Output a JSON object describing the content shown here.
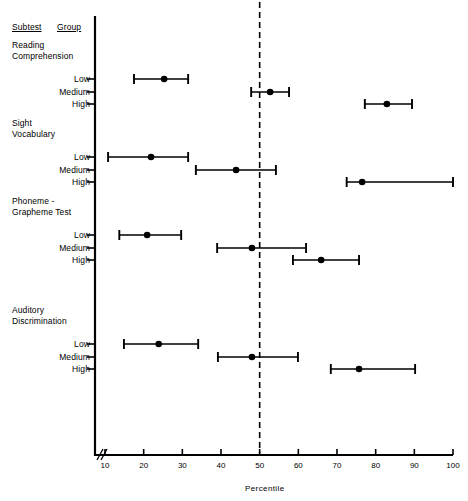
{
  "headers": {
    "subtest": "Subtest",
    "group": "Group"
  },
  "axis": {
    "title": "Percentile",
    "ticks": [
      10,
      20,
      30,
      40,
      50,
      60,
      70,
      80,
      90,
      100
    ],
    "break_symbol": "axis-break",
    "reference_line_value": 50,
    "xmin": 10,
    "xmax": 100
  },
  "chart_data": {
    "type": "scatter",
    "title": "",
    "xlabel": "Percentile",
    "ylabel": "",
    "xlim": [
      10,
      100
    ],
    "grid": false,
    "legend": null,
    "annotations": [
      {
        "type": "vline",
        "value": 50,
        "style": "dashed",
        "label": "50th percentile"
      },
      {
        "type": "axis-break",
        "position": "x-origin"
      }
    ],
    "error_bar_orientation": "horizontal",
    "groups": [
      {
        "subtest": "Reading Comprehension",
        "subtest_lines": [
          "Reading",
          "Comprehension"
        ],
        "rows": [
          {
            "group": "Low",
            "value": 25.3,
            "low": 17.5,
            "high": 31.5
          },
          {
            "group": "Medium",
            "value": 52.7,
            "low": 47.8,
            "high": 57.6
          },
          {
            "group": "High",
            "value": 82.9,
            "low": 77.2,
            "high": 89.4
          }
        ]
      },
      {
        "subtest": "Sight Vocabulary",
        "subtest_lines": [
          "Sight",
          "Vocabulary"
        ],
        "rows": [
          {
            "group": "Low",
            "value": 21.9,
            "low": 10.8,
            "high": 31.5
          },
          {
            "group": "Medium",
            "value": 43.9,
            "low": 33.5,
            "high": 54.2
          },
          {
            "group": "High",
            "value": 76.5,
            "low": 72.5,
            "high": 100.0
          }
        ]
      },
      {
        "subtest": "Phoneme-Grapheme Test",
        "subtest_lines": [
          "Phoneme -",
          "Grapheme Test"
        ],
        "rows": [
          {
            "group": "Low",
            "value": 20.9,
            "low": 13.7,
            "high": 29.7
          },
          {
            "group": "Medium",
            "value": 48.0,
            "low": 39.0,
            "high": 62.0
          },
          {
            "group": "High",
            "value": 65.9,
            "low": 58.6,
            "high": 75.7
          }
        ]
      },
      {
        "subtest": "Auditory Discrimination",
        "subtest_lines": [
          "Auditory",
          "Discrimination"
        ],
        "rows": [
          {
            "group": "Low",
            "value": 23.9,
            "low": 14.9,
            "high": 34.1
          },
          {
            "group": "Medium",
            "value": 48.0,
            "low": 39.2,
            "high": 59.9
          },
          {
            "group": "High",
            "value": 75.7,
            "low": 68.4,
            "high": 90.2
          }
        ]
      }
    ]
  }
}
